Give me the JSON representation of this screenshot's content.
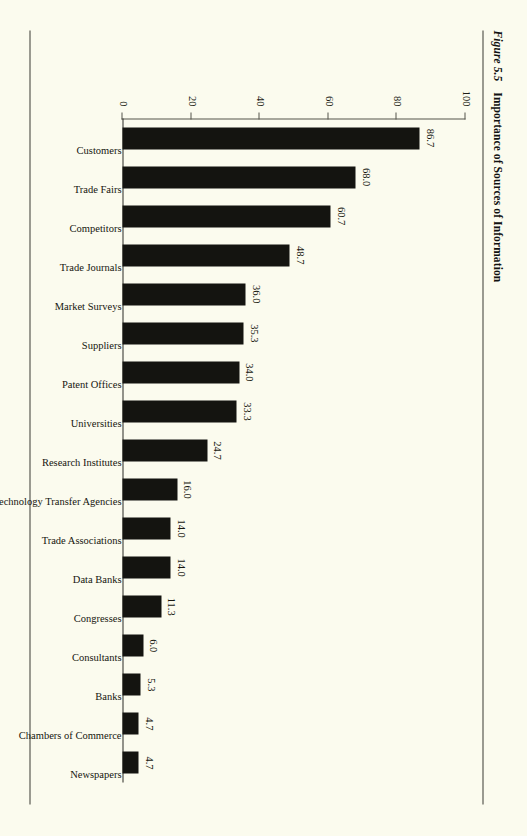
{
  "figure": {
    "number": "Figure 5.5",
    "title": "Importance of Sources of Information"
  },
  "chart_data": {
    "type": "bar",
    "title": "Importance of Sources of Information",
    "xlabel": "",
    "ylabel": "Frequency in Percentage",
    "orientation": "vertical",
    "ylim": [
      0,
      100
    ],
    "yticks": [
      "0",
      "20",
      "40",
      "60",
      "80",
      "100"
    ],
    "grid": false,
    "legend": "none",
    "value_labels": true,
    "categories": [
      "Customers",
      "Trade Fairs",
      "Competitors",
      "Trade Journals",
      "Market Surveys",
      "Suppliers",
      "Patent Offices",
      "Universities",
      "Research Institutes",
      "Technology Transfer Agencies",
      "Trade Associations",
      "Data Banks",
      "Congresses",
      "Consultants",
      "Banks",
      "Chambers of Commerce",
      "Newspapers"
    ],
    "values": [
      86.7,
      68.0,
      60.7,
      48.7,
      36.0,
      35.3,
      34.0,
      33.3,
      24.7,
      16.0,
      14.0,
      14.0,
      11.3,
      6.0,
      5.3,
      4.7,
      4.7
    ],
    "value_label_text": [
      "86.7",
      "68.0",
      "60.7",
      "48.7",
      "36.0",
      "35.3",
      "34.0",
      "33.3",
      "24.7",
      "16.0",
      "14.0",
      "14.0",
      "11.3",
      "6.0",
      "5.3",
      "4.7",
      "4.7"
    ],
    "bar_color": "#141410"
  },
  "colors": {
    "page_background": "#fbfbee",
    "bar": "#141410",
    "rule": "#3a3a32",
    "axis": "#55554a",
    "text": "#16160f"
  }
}
